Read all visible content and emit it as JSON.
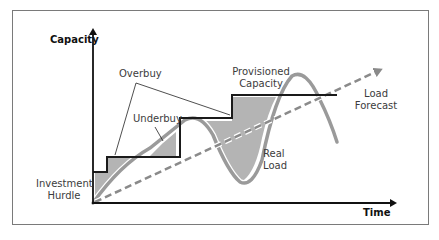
{
  "diagram": {
    "axes": {
      "y_label": "Capacity",
      "x_label": "Time"
    },
    "labels": {
      "overbuy": "Overbuy",
      "underbuy": "Underbuy",
      "provisioned_capacity_line1": "Provisioned",
      "provisioned_capacity_line2": "Capacity",
      "load_forecast_line1": "Load",
      "load_forecast_line2": "Forecast",
      "real_load_line1": "Real",
      "real_load_line2": "Load",
      "investment_hurdle_line1": "Investment",
      "investment_hurdle_line2": "Hurdle"
    },
    "series": [
      {
        "name": "Provisioned Capacity",
        "style": "step line",
        "color": "#1a1a1a"
      },
      {
        "name": "Real Load",
        "style": "thick curve",
        "color": "#9a9a9a"
      },
      {
        "name": "Load Forecast",
        "style": "dashed arrow",
        "color": "#808080"
      }
    ],
    "colors": {
      "shaded_region": "#b4b4b4",
      "frame": "#7a7a7a",
      "axis": "#111111"
    }
  }
}
